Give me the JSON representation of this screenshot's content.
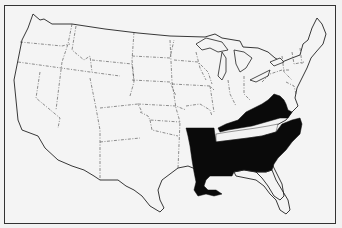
{
  "map": {
    "type": "US states map",
    "fill_color": "#0a0a0a",
    "background_color": "#f4f4f4",
    "border_style": "dashed",
    "highlighted_states": [
      "Virginia",
      "West Virginia",
      "Kentucky",
      "North Carolina",
      "South Carolina",
      "Georgia",
      "Alabama",
      "Mississippi",
      "Louisiana",
      "Arkansas"
    ],
    "unhighlighted_enclosed_states": [
      "Tennessee"
    ]
  }
}
